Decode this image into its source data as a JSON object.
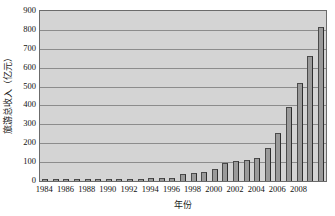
{
  "chart_data": {
    "type": "bar",
    "title": "",
    "xlabel": "年份",
    "ylabel": "旅游总收入（亿元）",
    "ylim": [
      0,
      900
    ],
    "ytick_step": 100,
    "grid": true,
    "legend": "none",
    "bar_color": "#9a9a9a",
    "plot_background": "#d4d4d4",
    "categories": [
      "1984",
      "1985",
      "1986",
      "1987",
      "1988",
      "1989",
      "1990",
      "1991",
      "1992",
      "1993",
      "1994",
      "1995",
      "1996",
      "1997",
      "1998",
      "1999",
      "2000",
      "2001",
      "2002",
      "2003",
      "2004",
      "2005",
      "2006",
      "2007",
      "2008",
      "2009"
    ],
    "values": [
      3,
      4,
      5,
      6,
      7,
      6,
      8,
      9,
      11,
      13,
      14,
      16,
      18,
      38,
      42,
      50,
      65,
      96,
      106,
      113,
      122,
      175,
      253,
      393,
      520,
      660
    ],
    "values_tail": [
      815
    ],
    "yticks": [
      "0",
      "100",
      "200",
      "300",
      "400",
      "500",
      "600",
      "700",
      "800",
      "900"
    ],
    "xticks": [
      "1984",
      "1986",
      "1988",
      "1990",
      "1992",
      "1994",
      "1996",
      "1998",
      "2000",
      "2002",
      "2004",
      "2006",
      "2008"
    ]
  }
}
